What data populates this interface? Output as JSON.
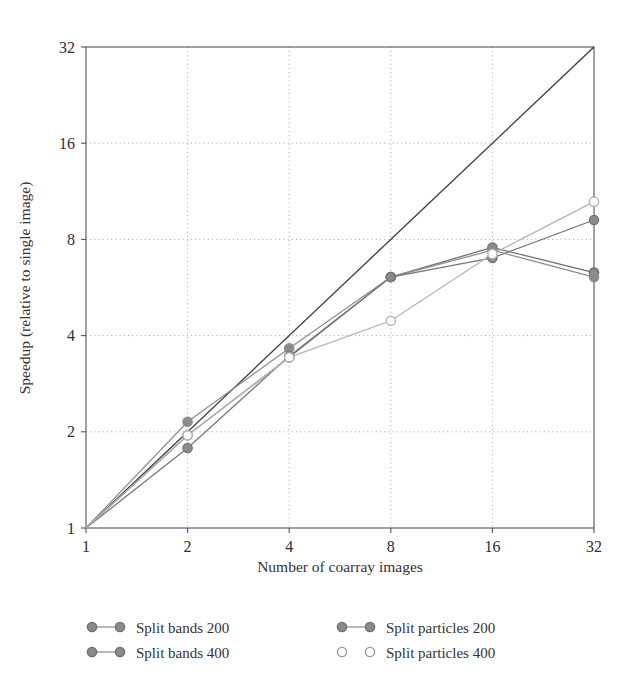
{
  "chart_data": {
    "type": "line",
    "title": "",
    "xlabel": "Number of coarray images",
    "ylabel": "Speedup (relative to single image)",
    "xscale": "log2",
    "yscale": "log2",
    "xlim": [
      1,
      32
    ],
    "ylim": [
      1,
      32
    ],
    "x": [
      1,
      2,
      4,
      8,
      16,
      32
    ],
    "xticklabels": [
      "1",
      "2",
      "4",
      "8",
      "16",
      "32"
    ],
    "yticks": [
      1,
      2,
      4,
      8,
      16,
      32
    ],
    "yticklabels": [
      "1",
      "2",
      "4",
      "8",
      "16",
      "32"
    ],
    "grid": true,
    "legend_position": "below",
    "reference_line": {
      "name": "ideal linear speedup",
      "x": [
        1,
        32
      ],
      "y": [
        1,
        32
      ],
      "color": "#3a3a3a"
    },
    "series": [
      {
        "name": "Split bands 200",
        "marker": "filled-circle",
        "color": "#6e6e6e",
        "marker_fill": "#8a8a8a",
        "values": [
          1,
          1.95,
          3.42,
          6.1,
          7.55,
          6.3
        ]
      },
      {
        "name": "Split bands 400",
        "marker": "filled-circle",
        "color": "#8d8d8d",
        "marker_fill": "#8a8a8a",
        "values": [
          1,
          2.15,
          3.65,
          6.1,
          7.4,
          6.1
        ]
      },
      {
        "name": "Split particles 200",
        "marker": "filled-circle",
        "color": "#757575",
        "marker_fill": "#8a8a8a",
        "values": [
          1,
          1.78,
          3.45,
          6.1,
          7.0,
          9.2
        ]
      },
      {
        "name": "Split particles 400",
        "marker": "open-circle",
        "color": "#b4b4b4",
        "marker_fill": "#ffffff",
        "values": [
          1,
          1.95,
          3.42,
          4.45,
          7.2,
          10.5
        ]
      }
    ]
  },
  "legend": {
    "entries": [
      {
        "label": "Split bands 200",
        "marker": "filled-circle",
        "connector": true
      },
      {
        "label": "Split bands 400",
        "marker": "filled-circle",
        "connector": true
      },
      {
        "label": "Split particles 200",
        "marker": "filled-circle",
        "connector": true
      },
      {
        "label": "Split particles 400",
        "marker": "open-circle",
        "connector": false
      }
    ]
  },
  "colors": {
    "frame": "#555555",
    "grid": "#9a9a9a",
    "ideal": "#3a3a3a",
    "marker_fill": "#8a8a8a",
    "marker_open_fill": "#ffffff",
    "text": "#333333"
  }
}
